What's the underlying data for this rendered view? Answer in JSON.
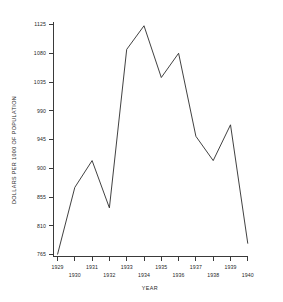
{
  "chart_data": {
    "type": "line",
    "title": "",
    "xlabel": "YEAR",
    "ylabel": "DOLLARS PER 1000 OF POPULATION",
    "categories": [
      "1929",
      "1930",
      "1931",
      "1932",
      "1933",
      "1934",
      "1935",
      "1936",
      "1937",
      "1938",
      "1939",
      "1940"
    ],
    "values": [
      765,
      870,
      912,
      838,
      1086,
      1123,
      1042,
      1080,
      950,
      912,
      968,
      782
    ],
    "series": [
      {
        "name": "Dollars per 1000 of population",
        "values": [
          765,
          870,
          912,
          838,
          1086,
          1123,
          1042,
          1080,
          950,
          912,
          968,
          782
        ]
      }
    ],
    "x": [
      "1929",
      "1930",
      "1931",
      "1932",
      "1933",
      "1934",
      "1935",
      "1936",
      "1937",
      "1938",
      "1939",
      "1940"
    ],
    "ylim": [
      765,
      1125
    ],
    "xlim": [
      "1929",
      "1940"
    ],
    "y_ticks": [
      1125,
      1080,
      1035,
      990,
      945,
      900,
      855,
      810,
      765
    ],
    "y_tick_labels": [
      "1125",
      "1080",
      "1035",
      "990",
      "945",
      "900",
      "855",
      "810",
      "765"
    ],
    "x_ticks": [
      "1929",
      "1930",
      "1931",
      "1932",
      "1933",
      "1934",
      "1935",
      "1936",
      "1937",
      "1938",
      "1939",
      "1940"
    ],
    "x_tick_labels": [
      "1929",
      "1930",
      "1931",
      "1932",
      "1933",
      "1934",
      "1935",
      "1936",
      "1937",
      "1938",
      "1939",
      "1940"
    ],
    "grid": false,
    "legend": false,
    "legend_position": "none",
    "line_color": "#2b2b2b",
    "axis_color": "#3a3a3a",
    "background_color": "#ffffff",
    "annotations": []
  },
  "axes": {
    "y_title": "DOLLARS PER 1000 OF POPULATION",
    "x_title": "YEAR"
  },
  "y_labels": {
    "t0": "1125",
    "t1": "1080",
    "t2": "1035",
    "t3": "990",
    "t4": "945",
    "t5": "900",
    "t6": "855",
    "t7": "810",
    "t8": "765"
  },
  "x_labels": {
    "t0": "1929",
    "t1": "1930",
    "t2": "1931",
    "t3": "1932",
    "t4": "1933",
    "t5": "1934",
    "t6": "1935",
    "t7": "1936",
    "t8": "1937",
    "t9": "1938",
    "t10": "1939",
    "t11": "1940"
  }
}
